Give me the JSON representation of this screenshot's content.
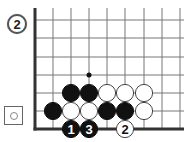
{
  "diagram": {
    "problem_number": "2",
    "legend_symbol": "empty-circle",
    "board": {
      "columns_x": [
        35,
        53,
        71,
        89,
        107,
        125,
        144,
        162,
        180
      ],
      "rows_y": [
        20,
        38,
        57,
        75,
        93,
        111,
        129
      ],
      "left_edge": true,
      "bottom_edge": true,
      "line_color": "#777777",
      "edge_color": "#333333"
    },
    "marker": {
      "col": 3,
      "row": 3,
      "type": "dot"
    },
    "stones": [
      {
        "col": 2,
        "row": 4,
        "color": "black",
        "label": ""
      },
      {
        "col": 3,
        "row": 4,
        "color": "black",
        "label": ""
      },
      {
        "col": 4,
        "row": 4,
        "color": "white",
        "label": ""
      },
      {
        "col": 5,
        "row": 4,
        "color": "white",
        "label": ""
      },
      {
        "col": 6,
        "row": 4,
        "color": "white",
        "label": ""
      },
      {
        "col": 1,
        "row": 5,
        "color": "black",
        "label": ""
      },
      {
        "col": 2,
        "row": 5,
        "color": "white",
        "label": ""
      },
      {
        "col": 3,
        "row": 5,
        "color": "white",
        "label": ""
      },
      {
        "col": 4,
        "row": 5,
        "color": "black",
        "label": ""
      },
      {
        "col": 5,
        "row": 5,
        "color": "black",
        "label": ""
      },
      {
        "col": 6,
        "row": 5,
        "color": "white",
        "label": ""
      },
      {
        "col": 2,
        "row": 6,
        "color": "black",
        "label": "1"
      },
      {
        "col": 3,
        "row": 6,
        "color": "black",
        "label": "3"
      },
      {
        "col": 5,
        "row": 6,
        "color": "white",
        "label": "2"
      }
    ]
  }
}
